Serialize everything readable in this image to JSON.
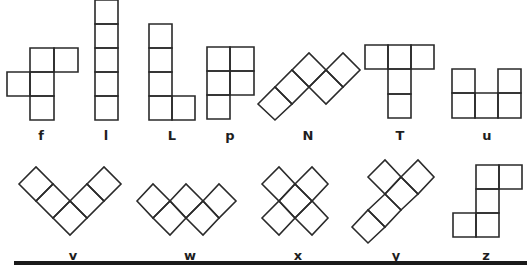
{
  "figure": {
    "stroke_color": "#2a2a2a",
    "background": "#ffffff",
    "rule_color": "#1a1a1a"
  },
  "pieces": [
    {
      "name": "f",
      "label": "f",
      "label_pos": [
        41,
        129
      ],
      "cells": [
        [
          [
            30,
            48
          ],
          [
            54,
            48
          ],
          [
            54,
            72
          ],
          [
            30,
            72
          ]
        ],
        [
          [
            54,
            48
          ],
          [
            78,
            48
          ],
          [
            78,
            72
          ],
          [
            54,
            72
          ]
        ],
        [
          [
            7,
            72
          ],
          [
            30,
            72
          ],
          [
            30,
            96
          ],
          [
            7,
            96
          ]
        ],
        [
          [
            30,
            72
          ],
          [
            54,
            72
          ],
          [
            54,
            96
          ],
          [
            30,
            96
          ]
        ],
        [
          [
            30,
            96
          ],
          [
            54,
            96
          ],
          [
            54,
            120
          ],
          [
            30,
            120
          ]
        ]
      ]
    },
    {
      "name": "l",
      "label": "l",
      "label_pos": [
        106,
        129
      ],
      "cells": [
        [
          [
            95,
            0
          ],
          [
            118,
            0
          ],
          [
            118,
            24
          ],
          [
            95,
            24
          ]
        ],
        [
          [
            95,
            24
          ],
          [
            118,
            24
          ],
          [
            118,
            48
          ],
          [
            95,
            48
          ]
        ],
        [
          [
            95,
            48
          ],
          [
            118,
            48
          ],
          [
            118,
            72
          ],
          [
            95,
            72
          ]
        ],
        [
          [
            95,
            72
          ],
          [
            118,
            72
          ],
          [
            118,
            96
          ],
          [
            95,
            96
          ]
        ],
        [
          [
            95,
            96
          ],
          [
            118,
            96
          ],
          [
            118,
            120
          ],
          [
            95,
            120
          ]
        ]
      ]
    },
    {
      "name": "L",
      "label": "L",
      "label_pos": [
        172,
        129
      ],
      "cells": [
        [
          [
            149,
            24
          ],
          [
            172,
            24
          ],
          [
            172,
            48
          ],
          [
            149,
            48
          ]
        ],
        [
          [
            149,
            48
          ],
          [
            172,
            48
          ],
          [
            172,
            72
          ],
          [
            149,
            72
          ]
        ],
        [
          [
            149,
            72
          ],
          [
            172,
            72
          ],
          [
            172,
            96
          ],
          [
            149,
            96
          ]
        ],
        [
          [
            149,
            96
          ],
          [
            172,
            96
          ],
          [
            172,
            120
          ],
          [
            149,
            120
          ]
        ],
        [
          [
            172,
            96
          ],
          [
            195,
            96
          ],
          [
            195,
            120
          ],
          [
            172,
            120
          ]
        ]
      ]
    },
    {
      "name": "p",
      "label": "p",
      "label_pos": [
        230,
        129
      ],
      "cells": [
        [
          [
            207,
            47
          ],
          [
            230,
            47
          ],
          [
            230,
            71
          ],
          [
            207,
            71
          ]
        ],
        [
          [
            230,
            47
          ],
          [
            254,
            47
          ],
          [
            254,
            71
          ],
          [
            230,
            71
          ]
        ],
        [
          [
            207,
            71
          ],
          [
            230,
            71
          ],
          [
            230,
            95
          ],
          [
            207,
            95
          ]
        ],
        [
          [
            230,
            71
          ],
          [
            254,
            71
          ],
          [
            254,
            95
          ],
          [
            230,
            95
          ]
        ],
        [
          [
            207,
            95
          ],
          [
            230,
            95
          ],
          [
            230,
            119
          ],
          [
            207,
            119
          ]
        ]
      ]
    },
    {
      "name": "N",
      "label": "N",
      "label_pos": [
        308,
        129
      ],
      "cells": [
        [
          [
            258,
            104
          ],
          [
            275,
            87
          ],
          [
            292,
            104
          ],
          [
            275,
            120
          ]
        ],
        [
          [
            275,
            87
          ],
          [
            292,
            70
          ],
          [
            309,
            87
          ],
          [
            292,
            104
          ]
        ],
        [
          [
            292,
            70
          ],
          [
            309,
            53
          ],
          [
            326,
            70
          ],
          [
            309,
            87
          ]
        ],
        [
          [
            309,
            87
          ],
          [
            326,
            70
          ],
          [
            343,
            87
          ],
          [
            326,
            104
          ]
        ],
        [
          [
            326,
            70
          ],
          [
            343,
            53
          ],
          [
            360,
            70
          ],
          [
            343,
            87
          ]
        ]
      ]
    },
    {
      "name": "T",
      "label": "T",
      "label_pos": [
        400,
        129
      ],
      "cells": [
        [
          [
            365,
            45
          ],
          [
            388,
            45
          ],
          [
            388,
            69
          ],
          [
            365,
            69
          ]
        ],
        [
          [
            388,
            45
          ],
          [
            411,
            45
          ],
          [
            411,
            69
          ],
          [
            388,
            69
          ]
        ],
        [
          [
            411,
            45
          ],
          [
            434,
            45
          ],
          [
            434,
            69
          ],
          [
            411,
            69
          ]
        ],
        [
          [
            388,
            69
          ],
          [
            411,
            69
          ],
          [
            411,
            94
          ],
          [
            388,
            94
          ]
        ],
        [
          [
            388,
            94
          ],
          [
            411,
            94
          ],
          [
            411,
            118
          ],
          [
            388,
            118
          ]
        ]
      ]
    },
    {
      "name": "u",
      "label": "u",
      "label_pos": [
        487,
        129
      ],
      "cells": [
        [
          [
            452,
            69
          ],
          [
            475,
            69
          ],
          [
            475,
            93
          ],
          [
            452,
            93
          ]
        ],
        [
          [
            498,
            69
          ],
          [
            521,
            69
          ],
          [
            521,
            93
          ],
          [
            498,
            93
          ]
        ],
        [
          [
            452,
            93
          ],
          [
            475,
            93
          ],
          [
            475,
            118
          ],
          [
            452,
            118
          ]
        ],
        [
          [
            475,
            93
          ],
          [
            498,
            93
          ],
          [
            498,
            118
          ],
          [
            475,
            118
          ]
        ],
        [
          [
            498,
            93
          ],
          [
            521,
            93
          ],
          [
            521,
            118
          ],
          [
            498,
            118
          ]
        ]
      ]
    },
    {
      "name": "v",
      "label": "v",
      "label_pos": [
        73,
        249
      ],
      "cells": [
        [
          [
            19,
            184
          ],
          [
            36,
            167
          ],
          [
            53,
            184
          ],
          [
            36,
            201
          ]
        ],
        [
          [
            36,
            201
          ],
          [
            53,
            184
          ],
          [
            70,
            201
          ],
          [
            53,
            218
          ]
        ],
        [
          [
            53,
            218
          ],
          [
            70,
            201
          ],
          [
            87,
            218
          ],
          [
            70,
            235
          ]
        ],
        [
          [
            70,
            201
          ],
          [
            87,
            184
          ],
          [
            104,
            201
          ],
          [
            87,
            218
          ]
        ],
        [
          [
            87,
            184
          ],
          [
            104,
            167
          ],
          [
            121,
            184
          ],
          [
            104,
            201
          ]
        ]
      ]
    },
    {
      "name": "w",
      "label": "w",
      "label_pos": [
        190,
        249
      ],
      "cells": [
        [
          [
            137,
            201
          ],
          [
            153,
            184
          ],
          [
            170,
            201
          ],
          [
            153,
            218
          ]
        ],
        [
          [
            153,
            218
          ],
          [
            170,
            201
          ],
          [
            186,
            218
          ],
          [
            170,
            235
          ]
        ],
        [
          [
            170,
            201
          ],
          [
            186,
            184
          ],
          [
            203,
            201
          ],
          [
            186,
            218
          ]
        ],
        [
          [
            186,
            218
          ],
          [
            203,
            201
          ],
          [
            219,
            218
          ],
          [
            203,
            235
          ]
        ],
        [
          [
            203,
            201
          ],
          [
            219,
            184
          ],
          [
            236,
            201
          ],
          [
            219,
            218
          ]
        ]
      ]
    },
    {
      "name": "x",
      "label": "x",
      "label_pos": [
        298,
        249
      ],
      "cells": [
        [
          [
            262,
            184
          ],
          [
            279,
            167
          ],
          [
            295,
            184
          ],
          [
            279,
            201
          ]
        ],
        [
          [
            295,
            184
          ],
          [
            312,
            167
          ],
          [
            328,
            184
          ],
          [
            312,
            201
          ]
        ],
        [
          [
            279,
            201
          ],
          [
            295,
            184
          ],
          [
            312,
            201
          ],
          [
            295,
            218
          ]
        ],
        [
          [
            262,
            218
          ],
          [
            279,
            201
          ],
          [
            295,
            218
          ],
          [
            279,
            235
          ]
        ],
        [
          [
            295,
            218
          ],
          [
            312,
            201
          ],
          [
            328,
            218
          ],
          [
            312,
            235
          ]
        ]
      ]
    },
    {
      "name": "y",
      "label": "y",
      "label_pos": [
        396,
        249
      ],
      "cells": [
        [
          [
            352,
            227
          ],
          [
            368,
            210
          ],
          [
            385,
            227
          ],
          [
            368,
            243
          ]
        ],
        [
          [
            368,
            210
          ],
          [
            385,
            194
          ],
          [
            401,
            210
          ],
          [
            385,
            227
          ]
        ],
        [
          [
            385,
            194
          ],
          [
            401,
            177
          ],
          [
            418,
            194
          ],
          [
            401,
            210
          ]
        ],
        [
          [
            368,
            177
          ],
          [
            385,
            160
          ],
          [
            401,
            177
          ],
          [
            385,
            194
          ]
        ],
        [
          [
            401,
            177
          ],
          [
            418,
            160
          ],
          [
            434,
            177
          ],
          [
            418,
            194
          ]
        ]
      ]
    },
    {
      "name": "z",
      "label": "z",
      "label_pos": [
        486,
        249
      ],
      "cells": [
        [
          [
            476,
            165
          ],
          [
            499,
            165
          ],
          [
            499,
            189
          ],
          [
            476,
            189
          ]
        ],
        [
          [
            499,
            165
          ],
          [
            522,
            165
          ],
          [
            522,
            189
          ],
          [
            499,
            189
          ]
        ],
        [
          [
            476,
            189
          ],
          [
            499,
            189
          ],
          [
            499,
            213
          ],
          [
            476,
            213
          ]
        ],
        [
          [
            453,
            213
          ],
          [
            476,
            213
          ],
          [
            476,
            237
          ],
          [
            453,
            237
          ]
        ],
        [
          [
            476,
            213
          ],
          [
            499,
            213
          ],
          [
            499,
            237
          ],
          [
            476,
            237
          ]
        ]
      ]
    }
  ]
}
